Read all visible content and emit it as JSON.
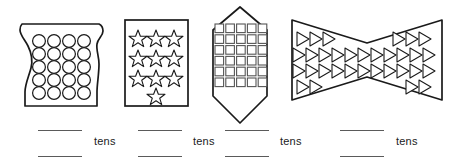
{
  "worksheet": {
    "title": "Count the objects in each shape and write how many tens",
    "unit_label": "tens",
    "line_color": "#5a5a5a",
    "outline_color": "#1a1a1a",
    "background_color": "#ffffff"
  },
  "problems": [
    {
      "id": "problem-1",
      "shape_name": "vase",
      "object_icon": "circle-icon",
      "object_name": "circle",
      "columns": 4,
      "rows": 5,
      "count": 20,
      "tens": 2,
      "unit_label": "tens",
      "answer_top": "",
      "answer_bottom": ""
    },
    {
      "id": "problem-2",
      "shape_name": "rectangle",
      "object_icon": "star-icon",
      "object_name": "star",
      "columns": 3,
      "rows": 4,
      "count": 10,
      "tens": 1,
      "unit_label": "tens",
      "answer_top": "",
      "answer_bottom": ""
    },
    {
      "id": "problem-3",
      "shape_name": "hexagon",
      "object_icon": "square-icon",
      "object_name": "square",
      "columns": 5,
      "rows": 6,
      "count": 30,
      "tens": 3,
      "unit_label": "tens",
      "answer_top": "",
      "answer_bottom": ""
    },
    {
      "id": "problem-4",
      "shape_name": "bowtie",
      "object_icon": "triangle-icon",
      "object_name": "triangle",
      "row_counts": [
        6,
        11,
        11,
        4
      ],
      "count": 32,
      "tens": 3,
      "unit_label": "tens",
      "answer_top": "",
      "answer_bottom": ""
    }
  ]
}
